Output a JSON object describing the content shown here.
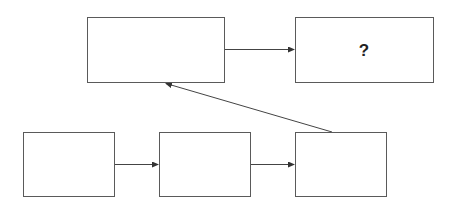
{
  "diagram": {
    "nodes": [
      {
        "id": "A",
        "label": "",
        "x": 87,
        "y": 17,
        "w": 137,
        "h": 65
      },
      {
        "id": "B",
        "label": "?",
        "x": 295,
        "y": 17,
        "w": 138,
        "h": 65
      },
      {
        "id": "C",
        "label": "",
        "x": 23,
        "y": 132,
        "w": 91,
        "h": 64
      },
      {
        "id": "D",
        "label": "",
        "x": 159,
        "y": 132,
        "w": 91,
        "h": 64
      },
      {
        "id": "E",
        "label": "",
        "x": 295,
        "y": 132,
        "w": 91,
        "h": 64
      }
    ],
    "edges": [
      {
        "from": "C",
        "to": "D"
      },
      {
        "from": "D",
        "to": "E"
      },
      {
        "from": "E",
        "to": "A"
      },
      {
        "from": "A",
        "to": "B"
      }
    ],
    "colors": {
      "stroke": "#5a5a5a",
      "arrow": "#444444",
      "background": "#ffffff"
    }
  }
}
